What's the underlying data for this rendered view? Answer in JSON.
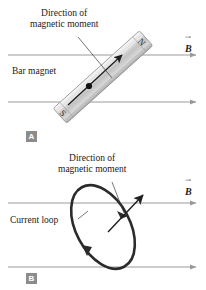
{
  "figure": {
    "background_color": "#ffffff",
    "field_line_color": "#9a9a9a",
    "ink_color": "#222222",
    "tag_background": "#8c8c8c",
    "tag_text_color": "#ffffff"
  },
  "panel_a": {
    "tag": "A",
    "moment_caption_line1": "Direction of",
    "moment_caption_line2": "magnetic moment",
    "object_label": "Bar magnet",
    "field_label": "B",
    "magnet": {
      "pole_north": "N",
      "pole_south": "S",
      "tilt_degrees": -42,
      "fill_light": "#f2f2f2",
      "fill_mid": "#c9c9c9",
      "fill_dark": "#a6a6a6",
      "edge_color": "#8f8f8f"
    },
    "field_lines": [
      {
        "y": 55,
        "x_start": 8,
        "x_end": 196
      },
      {
        "y": 102,
        "x_start": 8,
        "x_end": 196
      }
    ]
  },
  "panel_b": {
    "tag": "B",
    "moment_caption_line1": "Direction of",
    "moment_caption_line2": "magnetic moment",
    "object_label": "Current loop",
    "field_label": "B",
    "loop": {
      "center_x": 103,
      "center_y": 82,
      "radius_x": 27,
      "radius_y": 45,
      "tilt_degrees": -28,
      "stroke_color": "#2b2b2b",
      "stroke_width": 2.6
    },
    "field_lines": [
      {
        "y": 58,
        "x_start": 8,
        "x_end": 196
      },
      {
        "y": 122,
        "x_start": 8,
        "x_end": 196
      }
    ]
  }
}
